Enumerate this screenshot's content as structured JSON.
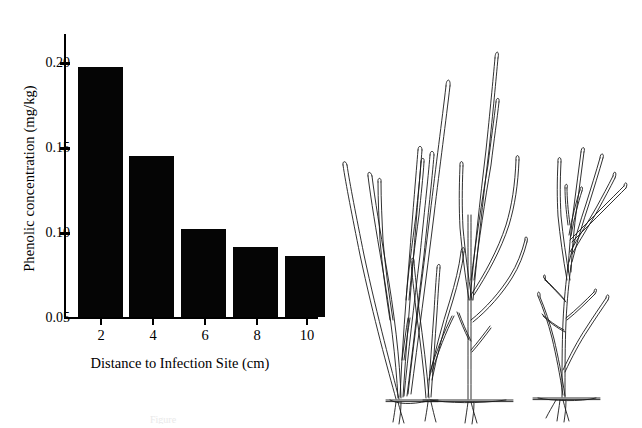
{
  "figure": {
    "caption_clipped": "Figure"
  },
  "chart_data": {
    "type": "bar",
    "title": "",
    "xlabel": "Distance to Infection Site (cm)",
    "ylabel": "Phenolic concentration (mg/kg)",
    "categories": [
      "2",
      "4",
      "6",
      "8",
      "10"
    ],
    "values": [
      0.197,
      0.145,
      0.102,
      0.091,
      0.086
    ],
    "ylim": [
      0.05,
      0.215
    ],
    "yticks": [
      "0.05",
      "0.10",
      "0.15",
      "0.20"
    ],
    "ytick_values": [
      0.05,
      0.1,
      0.15,
      0.2
    ],
    "xticks": [
      "2",
      "4",
      "6",
      "8",
      "10"
    ],
    "grid": false,
    "legend": "none",
    "bar_color": "#050505"
  },
  "illustration": {
    "name": "botanical-line-drawing",
    "description": "Three slender branching plant specimens with rhizomes drawn in ink outline"
  }
}
